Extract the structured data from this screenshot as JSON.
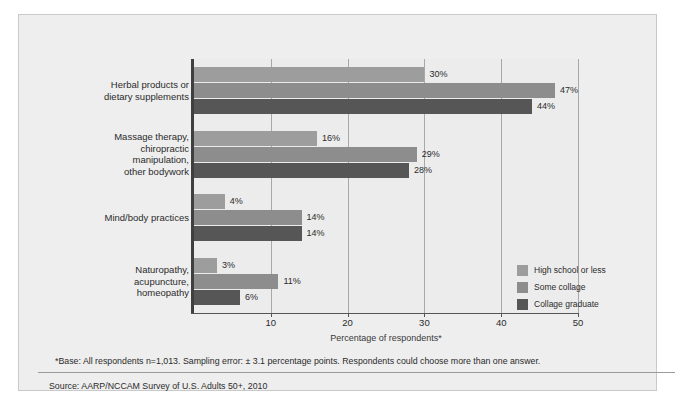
{
  "chart_data": {
    "type": "bar",
    "orientation": "horizontal",
    "title": "",
    "xlabel": "Percentage of respondents*",
    "ylabel": "",
    "xlim": [
      0,
      50
    ],
    "xticks": [
      10,
      20,
      30,
      40,
      50
    ],
    "grid": true,
    "legend_position": "right-bottom",
    "categories": [
      "Herbal products or\ndietary supplements",
      "Massage therapy,\nchiropractic\nmanipulation,\nother bodywork",
      "Mind/body practices",
      "Naturopathy,\nacupuncture,\nhomeopathy"
    ],
    "series": [
      {
        "name": "High school or less",
        "color": "#9d9d9d",
        "values": [
          30,
          16,
          4,
          3
        ],
        "labels": [
          "30%",
          "16%",
          "4%",
          "3%"
        ]
      },
      {
        "name": "Some collage",
        "color": "#8d8d8d",
        "values": [
          47,
          29,
          14,
          11
        ],
        "labels": [
          "47%",
          "29%",
          "14%",
          "11%"
        ]
      },
      {
        "name": "Collage graduate",
        "color": "#565656",
        "values": [
          44,
          28,
          14,
          6
        ],
        "labels": [
          "44%",
          "28%",
          "14%",
          "6%"
        ]
      }
    ]
  },
  "categories_display": [
    {
      "lines": [
        "Herbal products or",
        "dietary supplements"
      ]
    },
    {
      "lines": [
        "Massage therapy,",
        "chiropractic",
        "manipulation,",
        "other bodywork"
      ]
    },
    {
      "lines": [
        "Mind/body practices"
      ]
    },
    {
      "lines": [
        "Naturopathy,",
        "acupuncture,",
        "homeopathy"
      ]
    }
  ],
  "axis": {
    "title": "Percentage of respondents*",
    "tick_labels": [
      "10",
      "20",
      "30",
      "40",
      "50"
    ]
  },
  "legend": {
    "items": [
      {
        "label": "High school or less",
        "color": "#9d9d9d"
      },
      {
        "label": "Some collage",
        "color": "#8d8d8d"
      },
      {
        "label": "Collage graduate",
        "color": "#565656"
      }
    ]
  },
  "notes": {
    "footnote": "*Base: All respondents n=1,013. Sampling error: ± 3.1 percentage points. Respondents could choose more than one answer.",
    "source": "Source: AARP/NCCAM Survey of U.S. Adults 50+, 2010"
  },
  "colors": {
    "frame_bg": "#eeeeee",
    "frame_border": "#c9c9c9",
    "plot_bg": "#ececec",
    "gridline": "#a8a8a8",
    "axis": "#3f3f3f",
    "text": "#2b2b2b"
  }
}
